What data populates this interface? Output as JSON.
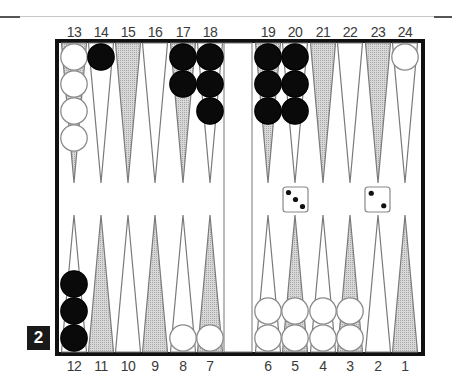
{
  "board": {
    "top_labels": [
      "13",
      "14",
      "15",
      "16",
      "17",
      "18",
      "19",
      "20",
      "21",
      "22",
      "23",
      "24"
    ],
    "bottom_labels": [
      "12",
      "11",
      "10",
      "9",
      "8",
      "7",
      "6",
      "5",
      "4",
      "3",
      "2",
      "1"
    ],
    "points": {
      "13": {
        "color": "white",
        "count": 4
      },
      "14": {
        "color": "black",
        "count": 1
      },
      "15": {
        "color": "none",
        "count": 0
      },
      "16": {
        "color": "none",
        "count": 0
      },
      "17": {
        "color": "black",
        "count": 2
      },
      "18": {
        "color": "black",
        "count": 3
      },
      "19": {
        "color": "black",
        "count": 3
      },
      "20": {
        "color": "black",
        "count": 3
      },
      "21": {
        "color": "none",
        "count": 0
      },
      "22": {
        "color": "none",
        "count": 0
      },
      "23": {
        "color": "none",
        "count": 0
      },
      "24": {
        "color": "white",
        "count": 1
      },
      "12": {
        "color": "black",
        "count": 3
      },
      "11": {
        "color": "none",
        "count": 0
      },
      "10": {
        "color": "none",
        "count": 0
      },
      "9": {
        "color": "none",
        "count": 0
      },
      "8": {
        "color": "white",
        "count": 1
      },
      "7": {
        "color": "white",
        "count": 1
      },
      "6": {
        "color": "white",
        "count": 2
      },
      "5": {
        "color": "white",
        "count": 2
      },
      "4": {
        "color": "white",
        "count": 2
      },
      "3": {
        "color": "white",
        "count": 2
      },
      "2": {
        "color": "none",
        "count": 0
      },
      "1": {
        "color": "none",
        "count": 0
      }
    },
    "dice": [
      3,
      2
    ],
    "doubling_cube": "2",
    "colors": {
      "frame": "#111111",
      "shaded_point": "#c4c4c4",
      "point_outline": "#7a7a7a",
      "black_checker": "#0a0a0a",
      "white_checker": "#ffffff",
      "checker_outline": "#8a8a8a"
    }
  }
}
